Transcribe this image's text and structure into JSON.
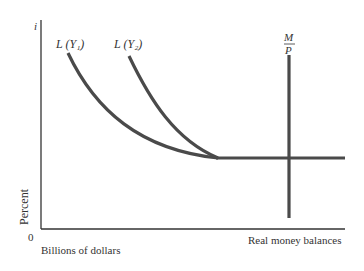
{
  "diagram": {
    "y_axis_symbol": "i",
    "y_axis_label": "Percent",
    "origin_label": "0",
    "x_axis_unit_label": "Billions of dollars",
    "x_axis_label": "Real money balances",
    "curves": [
      {
        "name": "L(Y1)",
        "label": "L (Y₁)"
      },
      {
        "name": "L(Y2)",
        "label": "L (Y₂)"
      }
    ],
    "supply_line": {
      "numerator": "M",
      "denominator": "P"
    },
    "colors": {
      "curve": "#4a4a4a",
      "axis": "#333333",
      "text": "#333333"
    }
  }
}
